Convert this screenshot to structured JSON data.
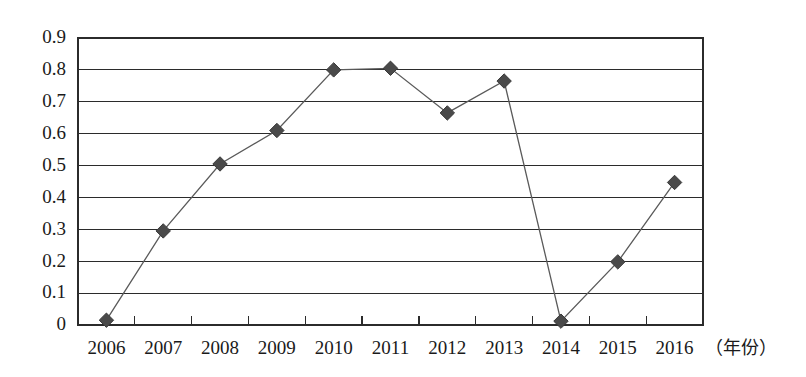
{
  "chart_data": {
    "type": "line",
    "title": "",
    "xlabel": "（年份）",
    "ylabel": "",
    "categories": [
      "2006",
      "2007",
      "2008",
      "2009",
      "2010",
      "2011",
      "2012",
      "2013",
      "2014",
      "2015",
      "2016"
    ],
    "values": [
      0.015,
      0.295,
      0.505,
      0.61,
      0.8,
      0.805,
      0.665,
      0.765,
      0.012,
      0.198,
      0.447
    ],
    "series": [
      {
        "name": "series-1",
        "values": [
          0.015,
          0.295,
          0.505,
          0.61,
          0.8,
          0.805,
          0.665,
          0.765,
          0.012,
          0.198,
          0.447
        ]
      }
    ],
    "ylim": [
      0,
      0.9
    ],
    "ytick_labels": [
      "0.9",
      "0.8",
      "0.7",
      "0.6",
      "0.5",
      "0.4",
      "0.3",
      "0.2",
      "0.1",
      "0"
    ],
    "ytick_values": [
      0.9,
      0.8,
      0.7,
      0.6,
      0.5,
      0.4,
      0.3,
      0.2,
      0.1,
      0
    ],
    "grid": true,
    "grid_axis": "y",
    "legend": false,
    "legend_position": "none",
    "marker": "diamond",
    "line_color": "#5a5a5a",
    "marker_color": "#4a4a4a",
    "axis_color": "#2b2b2b",
    "background_color": "#ffffff"
  }
}
